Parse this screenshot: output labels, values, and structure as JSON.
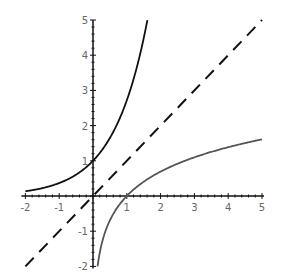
{
  "chart_data": {
    "type": "line",
    "title": "",
    "xlabel": "",
    "ylabel": "",
    "xlim": [
      -2,
      5
    ],
    "ylim": [
      -2,
      5
    ],
    "grid": false,
    "legend": null,
    "x_ticks": [
      "-2",
      "-1",
      "1",
      "2",
      "3",
      "4",
      "5"
    ],
    "y_ticks": [
      "-2",
      "-1",
      "1",
      "2",
      "3",
      "4",
      "5"
    ],
    "series": [
      {
        "name": "e^x",
        "style": "solid",
        "color": "#111111",
        "x": [
          -2,
          -1.5,
          -1,
          -0.5,
          0,
          0.5,
          1,
          1.25,
          1.5,
          1.609
        ],
        "y": [
          0.135,
          0.223,
          0.368,
          0.607,
          1,
          1.649,
          2.718,
          3.49,
          4.482,
          5
        ]
      },
      {
        "name": "y = x",
        "style": "dashed",
        "color": "#111111",
        "x": [
          -2,
          5
        ],
        "y": [
          -2,
          5
        ]
      },
      {
        "name": "ln x",
        "style": "solid",
        "color": "#555555",
        "x": [
          0.135,
          0.2,
          0.3,
          0.5,
          0.75,
          1,
          1.5,
          2,
          3,
          4,
          5
        ],
        "y": [
          -2,
          -1.609,
          -1.204,
          -0.693,
          -0.288,
          0,
          0.405,
          0.693,
          1.099,
          1.386,
          1.609
        ]
      }
    ]
  }
}
